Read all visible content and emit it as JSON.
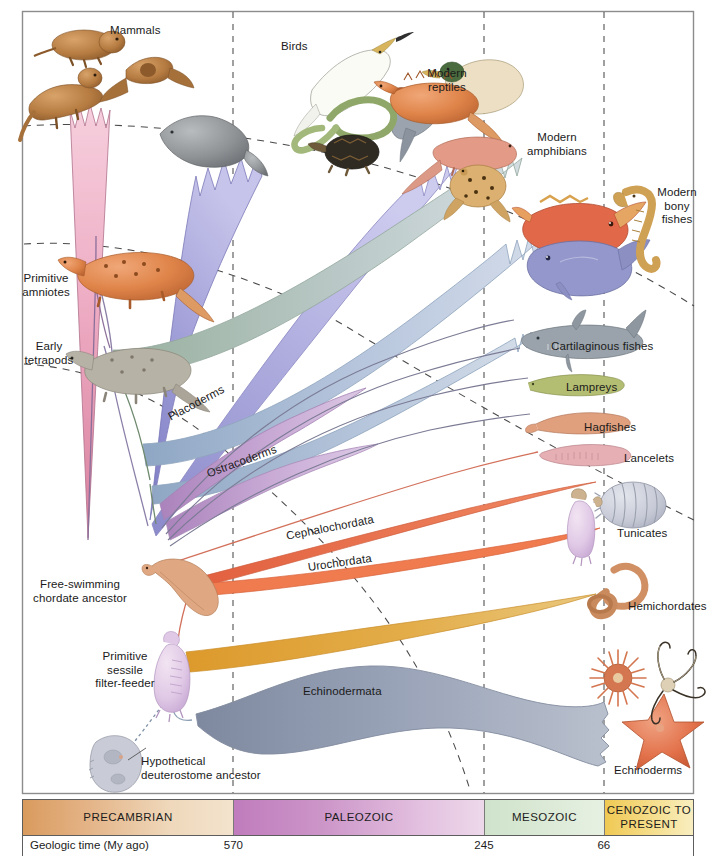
{
  "figure": {
    "type": "phylogenetic-tree"
  },
  "clade_labels": [
    {
      "id": "mammals",
      "text": "Mammals"
    },
    {
      "id": "birds",
      "text": "Birds"
    },
    {
      "id": "modern-reptiles",
      "text": "Modern\nreptiles"
    },
    {
      "id": "modern-amphibians",
      "text": "Modern\namphibians"
    },
    {
      "id": "modern-bony-fishes",
      "text": "Modern\nbony\nfishes"
    },
    {
      "id": "cartilaginous-fishes",
      "text": "Cartilaginous fishes"
    },
    {
      "id": "lampreys",
      "text": "Lampreys"
    },
    {
      "id": "hagfishes",
      "text": "Hagfishes"
    },
    {
      "id": "lancelets",
      "text": "Lancelets"
    },
    {
      "id": "tunicates",
      "text": "Tunicates"
    },
    {
      "id": "hemichordates",
      "text": "Hemichordates"
    },
    {
      "id": "echinoderms",
      "text": "Echinoderms"
    }
  ],
  "ancestor_labels": [
    {
      "id": "primitive-amniotes",
      "text": "Primitive\namniotes"
    },
    {
      "id": "early-tetrapods",
      "text": "Early\ntetrapods"
    },
    {
      "id": "free-swimming-chordate-ancestor",
      "text": "Free-swimming\nchordate ancestor"
    },
    {
      "id": "primitive-sessile-filter-feeder",
      "text": "Primitive\nsessile\nfilter-feeder"
    },
    {
      "id": "hypothetical-deuterostome-ancestor",
      "text": "Hypothetical\ndeuterostome ancestor"
    }
  ],
  "lineage_labels": [
    {
      "id": "placoderms",
      "text": "Placoderms"
    },
    {
      "id": "ostracoderms",
      "text": "Ostracoderms"
    },
    {
      "id": "cephalochordata",
      "text": "Cephalochordata"
    },
    {
      "id": "urochordata",
      "text": "Urochordata"
    },
    {
      "id": "echinodermata",
      "text": "Echinodermata"
    }
  ],
  "timescale": {
    "axis_label": "Geologic time (My ago)",
    "eras": [
      {
        "name": "PRECAMBRIAN",
        "color": "#d99b5e"
      },
      {
        "name": "PALEOZOIC",
        "color": "#c07cbd"
      },
      {
        "name": "MESOZOIC",
        "color": "#cfe3cb"
      },
      {
        "name": "CENOZOIC\nTO PRESENT",
        "color": "#f0c954"
      }
    ],
    "ticks": [
      {
        "value": "570",
        "x_pct": 31.4
      },
      {
        "value": "245",
        "x_pct": 68.8
      },
      {
        "value": "66",
        "x_pct": 86.7
      }
    ]
  },
  "palette": {
    "mammals_band": "#f1b9cb",
    "birds_band": "#9f9ed6",
    "reptiles_band": "#a5a4d8",
    "amphibians_band": "#c3cfd4",
    "bony_fishes_band": "#c4cfe2",
    "cartilaginous_band": "#b9cbe0",
    "placoderms_band": "#bb98c7",
    "ostracoderms_band": "#c3a2cd",
    "cephalochordata_line": "#e8694a",
    "urochordata_line": "#ef7b4f",
    "hemichordate_band": "#e0a33f",
    "echinodermata_band": "#9aa4bb",
    "lamprey_line": "#8f8fa8",
    "hagfish_line": "#8f8fa8",
    "stem_line": "#7b7b95",
    "dashed_guide": "#4a4a4a"
  }
}
